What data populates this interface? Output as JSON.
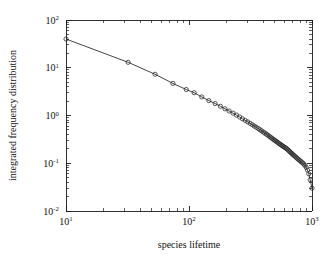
{
  "chart_data": {
    "type": "line",
    "title": "",
    "subtitle": "",
    "xlabel": "species lifetime",
    "ylabel": "integrated frequency distribution",
    "xscale": "log",
    "yscale": "log",
    "xlim": [
      10,
      1000
    ],
    "ylim": [
      0.01,
      100
    ],
    "grid": false,
    "legend": null,
    "marker": "open-circle",
    "line_style": "solid",
    "color": "#232323",
    "xticks": [
      10,
      100,
      1000
    ],
    "xtick_labels": [
      "10¹",
      "10²",
      "10³"
    ],
    "xtick_mantissas": [
      "10",
      "10",
      "10"
    ],
    "xtick_exponents": [
      "1",
      "2",
      "3"
    ],
    "yticks": [
      0.01,
      0.1,
      1,
      10,
      100
    ],
    "ytick_labels": [
      "10⁻²",
      "10⁻¹",
      "10⁰",
      "10¹",
      "10²"
    ],
    "ytick_mantissas": [
      "10",
      "10",
      "10",
      "10",
      "10"
    ],
    "ytick_exponents": [
      "-2",
      "-1",
      "0",
      "1",
      "2"
    ],
    "series": [
      {
        "name": "integrated frequency distribution",
        "x": [
          10,
          32,
          53,
          74,
          95,
          110,
          127,
          145,
          163,
          180,
          196,
          212,
          228,
          243,
          258,
          272,
          286,
          300,
          314,
          327,
          340,
          353,
          366,
          378,
          390,
          402,
          414,
          426,
          437,
          448,
          459,
          470,
          481,
          492,
          503,
          514,
          525,
          536,
          547,
          558,
          569,
          580,
          591,
          602,
          613,
          625,
          637,
          649,
          661,
          673,
          686,
          699,
          712,
          726,
          740,
          755,
          770,
          786,
          802,
          819,
          837,
          856,
          876,
          897,
          919,
          942,
          966,
          1000
        ],
        "y": [
          40.0,
          13.0,
          7.3,
          4.7,
          3.5,
          3.0,
          2.45,
          2.05,
          1.78,
          1.56,
          1.38,
          1.24,
          1.12,
          1.02,
          0.93,
          0.855,
          0.79,
          0.735,
          0.685,
          0.64,
          0.6,
          0.565,
          0.532,
          0.502,
          0.475,
          0.45,
          0.427,
          0.406,
          0.387,
          0.369,
          0.352,
          0.337,
          0.322,
          0.309,
          0.296,
          0.285,
          0.274,
          0.263,
          0.254,
          0.245,
          0.236,
          0.228,
          0.221,
          0.214,
          0.207,
          0.2,
          0.191,
          0.183,
          0.175,
          0.167,
          0.16,
          0.153,
          0.146,
          0.14,
          0.134,
          0.128,
          0.122,
          0.117,
          0.112,
          0.107,
          0.102,
          0.097,
          0.09,
          0.082,
          0.072,
          0.06,
          0.045,
          0.03
        ]
      }
    ],
    "annotations": []
  },
  "plot_geometry": {
    "left": 66,
    "right": 312,
    "top": 20,
    "bottom": 211
  }
}
